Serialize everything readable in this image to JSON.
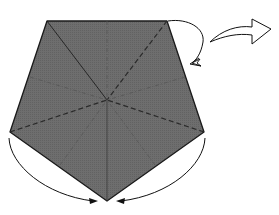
{
  "diagram": {
    "type": "origami-fold-step",
    "description": "Pentagon with crease lines; fold top-right flap behind, turn over, bring side corners to the bottom point",
    "colors": {
      "paper": "#6b6b6b",
      "edge": "#1a1a1a",
      "crease_valley": "#2a2a2a",
      "crease_mountain": "#555555",
      "arrow": "#111111",
      "background": "#ffffff"
    },
    "pentagon": {
      "vertices": [
        [
          47,
          21
        ],
        [
          167,
          21
        ],
        [
          204,
          132
        ],
        [
          107,
          201
        ],
        [
          10,
          132
        ]
      ],
      "center": [
        107,
        100
      ]
    },
    "creases": [
      {
        "kind": "solid",
        "from": [
          47,
          21
        ],
        "to": [
          107,
          100
        ]
      },
      {
        "kind": "solid",
        "from": [
          107,
          100
        ],
        "to": [
          107,
          201
        ]
      },
      {
        "kind": "valley-dashed",
        "from": [
          167,
          21
        ],
        "to": [
          107,
          100
        ]
      },
      {
        "kind": "valley-dashed",
        "from": [
          10,
          132
        ],
        "to": [
          107,
          100
        ]
      },
      {
        "kind": "valley-dashed",
        "from": [
          204,
          132
        ],
        "to": [
          107,
          100
        ]
      },
      {
        "kind": "mountain-dashed",
        "from": [
          107,
          21
        ],
        "to": [
          107,
          100
        ]
      },
      {
        "kind": "mountain-dashed",
        "from": [
          30,
          77
        ],
        "to": [
          107,
          100
        ]
      },
      {
        "kind": "mountain-dashed",
        "from": [
          185,
          77
        ],
        "to": [
          107,
          100
        ]
      },
      {
        "kind": "mountain-dashed",
        "from": [
          60,
          165
        ],
        "to": [
          107,
          100
        ]
      },
      {
        "kind": "mountain-dashed",
        "from": [
          155,
          165
        ],
        "to": [
          107,
          100
        ]
      }
    ],
    "arrows": [
      {
        "name": "fold-behind-arrow",
        "kind": "curved-open-head"
      },
      {
        "name": "turn-over-arrow",
        "kind": "hollow-outline"
      },
      {
        "name": "fold-left-corner-arrow",
        "kind": "curved-filled-head"
      },
      {
        "name": "fold-right-corner-arrow",
        "kind": "curved-filled-head"
      }
    ]
  }
}
